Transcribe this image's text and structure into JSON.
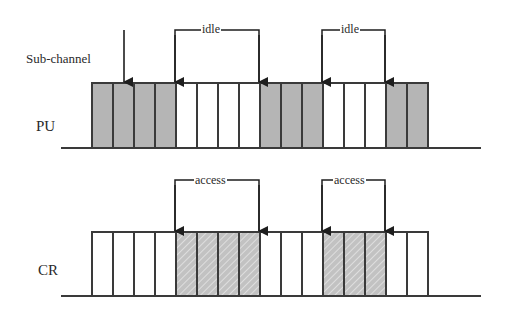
{
  "diagram": {
    "type": "spectrum-access-timeline",
    "labels": {
      "subchannel": "Sub-channel",
      "pu": "PU",
      "cr": "CR"
    },
    "colors": {
      "line": "#3a3a3a",
      "occupied_fill": "#b5b5b5",
      "hatch_fill": "#c2c2c2",
      "hatch_stroke": "#e6e6e6",
      "empty_fill": "#ffffff"
    },
    "cells": 16,
    "pu_row": {
      "label": "PU",
      "states": [
        "busy",
        "busy",
        "busy",
        "busy",
        "idle",
        "idle",
        "idle",
        "idle",
        "busy",
        "busy",
        "busy",
        "idle",
        "idle",
        "idle",
        "busy",
        "busy"
      ]
    },
    "cr_row": {
      "label": "CR",
      "states": [
        "empty",
        "empty",
        "empty",
        "empty",
        "access",
        "access",
        "access",
        "access",
        "empty",
        "empty",
        "empty",
        "access",
        "access",
        "access",
        "empty",
        "empty"
      ]
    },
    "pu_brackets": [
      {
        "label": "idle",
        "from_cell": 4,
        "to_cell": 8
      },
      {
        "label": "idle",
        "from_cell": 11,
        "to_cell": 14
      }
    ],
    "cr_brackets": [
      {
        "label": "access",
        "from_cell": 4,
        "to_cell": 8
      },
      {
        "label": "access",
        "from_cell": 11,
        "to_cell": 14
      }
    ]
  }
}
